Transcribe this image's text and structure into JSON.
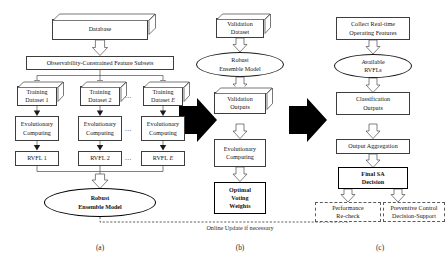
{
  "figure": {
    "type": "flowchart",
    "panels": [
      {
        "id": "a",
        "caption": "(a)",
        "nodes": [
          {
            "name": "database",
            "shape": "box3d",
            "label": "Database"
          },
          {
            "name": "feature-subsets",
            "shape": "rect",
            "label": "Observability-Constrained Feature Subsets"
          },
          {
            "name": "training-dataset-1",
            "shape": "box3d",
            "label": "Training\nDataset 1"
          },
          {
            "name": "training-dataset-2",
            "shape": "box3d",
            "label": "Training\nDataset 2"
          },
          {
            "name": "training-dataset-e",
            "shape": "box3d",
            "label": "Training\nDataset E"
          },
          {
            "name": "evolutionary-computing-1",
            "shape": "rect",
            "label": "Evolutionary\nComputing"
          },
          {
            "name": "evolutionary-computing-2",
            "shape": "rect",
            "label": "Evolutionary\nComputing"
          },
          {
            "name": "evolutionary-computing-e",
            "shape": "rect",
            "label": "Evolutionary\nComputing"
          },
          {
            "name": "rvfl-1",
            "shape": "rect",
            "label": "RVFL 1"
          },
          {
            "name": "rvfl-2",
            "shape": "rect",
            "label": "RVFL 2"
          },
          {
            "name": "rvfl-e",
            "shape": "rect",
            "label": "RVFL E"
          },
          {
            "name": "robust-ensemble-model",
            "shape": "ellipse-bold",
            "label": "Robust\nEnsemble  Model"
          }
        ]
      },
      {
        "id": "b",
        "caption": "(b)",
        "nodes": [
          {
            "name": "validation-dataset",
            "shape": "box3d",
            "label": "Validation\nDataset"
          },
          {
            "name": "robust-ensemble-model",
            "shape": "ellipse",
            "label": "Robust\nEnsemble  Model"
          },
          {
            "name": "validation-outputs",
            "shape": "box3d",
            "label": "Validation\nOutputs"
          },
          {
            "name": "evolutionary-computing",
            "shape": "rect",
            "label": "Evolutionary\nComputing"
          },
          {
            "name": "optimal-voting-weights",
            "shape": "rect-bold",
            "label": "Optimal\nVoting\nWeights"
          }
        ]
      },
      {
        "id": "c",
        "caption": "(c)",
        "nodes": [
          {
            "name": "collect-real-time-operating-features",
            "shape": "rect",
            "label": "Collect Real-time\nOperating Features"
          },
          {
            "name": "available-rvfls",
            "shape": "ellipse",
            "label": "Available\nRVFLs"
          },
          {
            "name": "classification-outputs",
            "shape": "rect",
            "label": "Classification\nOutputs"
          },
          {
            "name": "output-aggregation",
            "shape": "rect",
            "label": "Output Aggregation"
          },
          {
            "name": "final-sa-decision",
            "shape": "rect-bold",
            "label": "Final SA\nDecision"
          },
          {
            "name": "performance-re-check",
            "shape": "rect-dashed",
            "label": "Performance\nRe-check"
          },
          {
            "name": "preventive-control-decision-support",
            "shape": "rect-dashed",
            "label": "Preventive Control\nDecision-Support"
          }
        ]
      }
    ],
    "stage_arrows": [
      {
        "name": "stage-arrow-a-to-b",
        "direction": "right"
      },
      {
        "name": "stage-arrow-b-to-c",
        "direction": "right"
      }
    ],
    "feedback": {
      "name": "online-update-feedback",
      "label": "Online Update if necessary",
      "style": "dashed"
    },
    "ellipsis": "..."
  },
  "labels": {
    "database": "Database",
    "feature_subsets": "Observability-Constrained Feature Subsets",
    "training_prefix": "Training",
    "dataset_1": "Dataset 1",
    "dataset_2": "Dataset 2",
    "dataset_e": "Dataset ",
    "dataset_e_sym": "E",
    "evo_line1": "Evolutionary",
    "evo_line2": "Computing",
    "rvfl_1": "RVFL 1",
    "rvfl_2": "RVFL 2",
    "rvfl_e_pre": "RVFL ",
    "rvfl_e_sym": "E",
    "robust_line1": "Robust",
    "robust_line2": "Ensemble  Model",
    "validation_line1": "Validation",
    "validation_line2": "Dataset",
    "validation_out_line1": "Validation",
    "validation_out_line2": "Outputs",
    "optimal_line1": "Optimal",
    "optimal_line2": "Voting",
    "optimal_line3": "Weights",
    "collect_line1": "Collect Real-time",
    "collect_line2": "Operating Features",
    "available_line1": "Available",
    "available_line2": "RVFLs",
    "classification_line1": "Classification",
    "classification_line2": "Outputs",
    "output_aggregation": "Output Aggregation",
    "final_line1": "Final SA",
    "final_line2": "Decision",
    "perf_line1": "Performance",
    "perf_line2": "Re-check",
    "prev_line1": "Preventive Control",
    "prev_line2": "Decision-Support",
    "online_update": "Online Update if necessary",
    "caption_a": "(a)",
    "caption_b": "(b)",
    "caption_c": "(c)",
    "dots": "..."
  },
  "colors": {
    "background": "#ffffff",
    "stroke": "#3d3d3d",
    "stroke_dark": "#000000",
    "dashed": "#5a5a5a",
    "text": "#111111",
    "arrow_fill": "#ffffff",
    "stage_arrow_fill": "#000000"
  }
}
